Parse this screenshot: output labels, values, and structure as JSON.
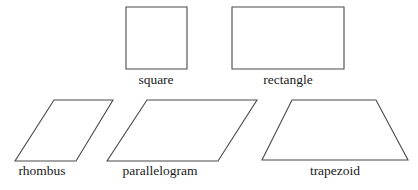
{
  "diagram": {
    "background": "#ffffff",
    "stroke_color": "#4a4a4a",
    "text_color": "#1a1a1a",
    "shapes": [
      {
        "name": "square",
        "label": "square",
        "points": "126,7 187,7 187,69 126,69",
        "label_x": 156,
        "label_y": 84
      },
      {
        "name": "rectangle",
        "label": "rectangle",
        "points": "232,7 344,7 344,69 232,69",
        "label_x": 288,
        "label_y": 84
      },
      {
        "name": "rhombus",
        "label": "rhombus",
        "points": "54,100 113,100 76,161 15,161",
        "label_x": 42,
        "label_y": 175
      },
      {
        "name": "parallelogram",
        "label": "parallelogram",
        "points": "147,100 257,100 218,161 107,161",
        "label_x": 160,
        "label_y": 175
      },
      {
        "name": "trapezoid",
        "label": "trapezoid",
        "points": "292,100 376,100 408,160 262,160",
        "label_x": 335,
        "label_y": 175
      }
    ]
  }
}
